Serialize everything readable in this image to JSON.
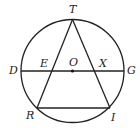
{
  "figure": {
    "type": "geometry",
    "colors": {
      "stroke": "#222222",
      "background": "#ffffff"
    },
    "circle": {
      "center": "O",
      "cx": 72.5,
      "cy": 71,
      "r": 51.5
    },
    "points": {
      "T": {
        "label": "T",
        "x": 72.5,
        "y": 19.5
      },
      "D": {
        "label": "D",
        "x": 21,
        "y": 71
      },
      "G": {
        "label": "G",
        "x": 124,
        "y": 71
      },
      "O": {
        "label": "O",
        "x": 72.5,
        "y": 71
      },
      "E": {
        "label": "E",
        "x": 51,
        "y": 71
      },
      "X": {
        "label": "X",
        "x": 95,
        "y": 71
      },
      "R": {
        "label": "R",
        "x": 37,
        "y": 108
      },
      "I": {
        "label": "I",
        "x": 110,
        "y": 108
      }
    },
    "segments": [
      {
        "from": "D",
        "to": "G"
      },
      {
        "from": "T",
        "to": "R"
      },
      {
        "from": "T",
        "to": "I"
      },
      {
        "from": "R",
        "to": "I"
      }
    ]
  }
}
